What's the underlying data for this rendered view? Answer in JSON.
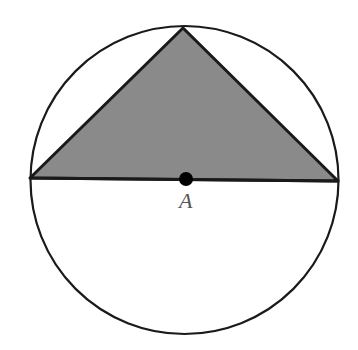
{
  "diagram": {
    "circle": {
      "cx": 184.5,
      "cy": 180,
      "r": 154,
      "stroke": "#1a1a1a",
      "fill": "none"
    },
    "triangle": {
      "points": [
        [
          30,
          178
        ],
        [
          183,
          28
        ],
        [
          338,
          181
        ]
      ],
      "fill": "#8a8a8a",
      "stroke": "#1a1a1a"
    },
    "diameter": {
      "x1": 30,
      "y1": 178,
      "x2": 338,
      "y2": 181
    },
    "center_point": {
      "cx": 186,
      "cy": 179,
      "r": 7,
      "fill": "#000000"
    },
    "labels": [
      {
        "text": "A",
        "x": 179,
        "y": 188
      }
    ]
  }
}
